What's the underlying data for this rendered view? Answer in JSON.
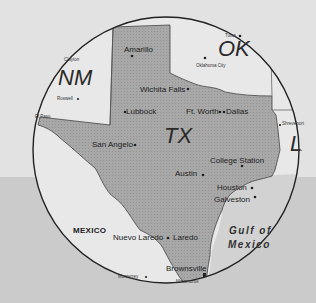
{
  "map": {
    "colors": {
      "texas": "#a8a8a8",
      "neighbors": "#e8e8e8",
      "gulf": "#d0d0d0",
      "outline": "#222222",
      "background_top": "#e2e2e2",
      "background_bottom": "#cbcbcb"
    },
    "states": {
      "nm": "NM",
      "ok": "OK",
      "tx": "TX",
      "la": "LA"
    },
    "countries": {
      "mexico": "MEXICO"
    },
    "water": {
      "gulf_line1": "Gulf of",
      "gulf_line2": "Mexico"
    },
    "cities": {
      "amarillo": "Amarillo",
      "wichita_falls": "Wichita Falls",
      "lubbock": "Lubbock",
      "ft_worth": "Ft. Worth",
      "dallas": "Dallas",
      "san_angelo": "San Angelo",
      "austin": "Austin",
      "college_station": "College Station",
      "houston": "Houston",
      "galveston": "Galveston",
      "nuevo_laredo": "Nuevo Laredo",
      "laredo": "Laredo",
      "brownsville": "Brownsville",
      "el_paso": "El Paso",
      "oklahoma_city": "Oklahoma City",
      "tulsa": "Tulsa",
      "shreveport": "Shreveport",
      "roswell": "Roswell",
      "clayton": "Clayton",
      "monterrey": "Monterrey",
      "matamoros": "Matamoros"
    }
  }
}
